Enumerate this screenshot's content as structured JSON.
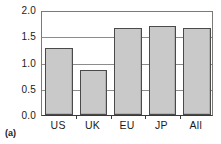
{
  "chart_data": {
    "type": "bar",
    "title": "",
    "subtitle": "",
    "xlabel": "",
    "ylabel": "",
    "categories": [
      "US",
      "UK",
      "EU",
      "JP",
      "All"
    ],
    "values": [
      1.28,
      0.86,
      1.66,
      1.69,
      1.66
    ],
    "ylim": [
      0.0,
      2.0
    ],
    "ytick_labels": [
      "2.0",
      "1.5",
      "1.0",
      "0.5",
      "0.0"
    ],
    "ytick_values": [
      2.0,
      1.5,
      1.0,
      0.5,
      0.0
    ],
    "grid": true,
    "grid_axis": "y",
    "legend": false,
    "legend_position": "none",
    "annotations": [
      {
        "name": "panel-label",
        "text": "(a)"
      }
    ],
    "colors": {
      "bar_fill": "#c9c9c9",
      "bar_edge": "#4a4a4a",
      "gridline": "#8c8c8c",
      "axis": "#3a3a3a",
      "text": "#1a1a1a",
      "background": "#ffffff"
    }
  }
}
